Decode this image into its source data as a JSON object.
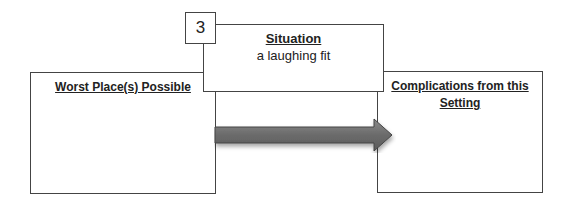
{
  "diagram": {
    "number": "3",
    "situation": {
      "heading": "Situation",
      "value": "a laughing fit"
    },
    "left_box": {
      "heading": "Worst Place(s) Possible"
    },
    "right_box": {
      "heading": "Complications from this Setting"
    },
    "arrow": {
      "direction": "right",
      "color": "#6b6b6b"
    }
  }
}
